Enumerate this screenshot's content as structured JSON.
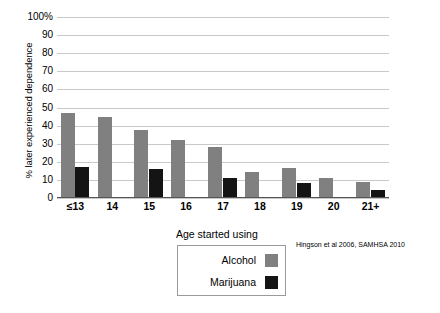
{
  "chart_data": {
    "type": "bar",
    "title": "",
    "subtitle": "",
    "xlabel": "Age started using",
    "ylabel": "% later experienced dependence",
    "categories": [
      "≤13",
      "14",
      "15",
      "16",
      "17",
      "18",
      "19",
      "20",
      "21+"
    ],
    "series": [
      {
        "name": "Alcohol",
        "color": "#808080",
        "values": [
          47,
          44.5,
          37.5,
          32,
          28,
          14.5,
          16.5,
          11,
          9
        ]
      },
      {
        "name": "Marijuana",
        "color": "#141414",
        "values": [
          17,
          null,
          16,
          null,
          11,
          null,
          8.5,
          null,
          4.5
        ]
      }
    ],
    "ylim": [
      0,
      100
    ],
    "yticks": [
      "0",
      "10",
      "20",
      "30",
      "40",
      "50",
      "60",
      "70",
      "80",
      "90",
      "100%"
    ],
    "ytick_values": [
      0,
      10,
      20,
      30,
      40,
      50,
      60,
      70,
      80,
      90,
      100
    ],
    "grid": true,
    "legend_position": "bottom-center",
    "annotation": "Hingson et al 2006, SAMHSA 2010"
  },
  "axis": {
    "y_title": "% later experienced dependence",
    "x_title": "Age started using"
  },
  "legend": {
    "title": "Age started using",
    "entries": [
      {
        "label": "Alcohol",
        "color": "#808080"
      },
      {
        "label": "Marijuana",
        "color": "#141414"
      }
    ]
  },
  "citation": {
    "text": "Hingson et al 2006, SAMHSA 2010"
  },
  "colors": {
    "alcohol": "#808080",
    "marijuana": "#141414",
    "gridline": "#c9c9c9",
    "axis": "#555555",
    "background": "#ffffff"
  }
}
